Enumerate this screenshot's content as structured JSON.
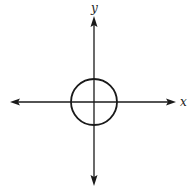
{
  "diagram": {
    "type": "coordinate-plane-with-circle",
    "colors": {
      "stroke": "#1a1a1a",
      "background": "#ffffff"
    },
    "axes": {
      "x_label": "x",
      "y_label": "y",
      "origin": {
        "px": 94,
        "py": 102
      },
      "x_axis": {
        "from": 10,
        "to": 176,
        "arrows": "both"
      },
      "y_axis": {
        "from": 16,
        "to": 186,
        "arrows": "both"
      }
    },
    "circle": {
      "center": {
        "px": 94,
        "py": 102
      },
      "radius_px": 23,
      "centered_at_origin": true
    }
  }
}
